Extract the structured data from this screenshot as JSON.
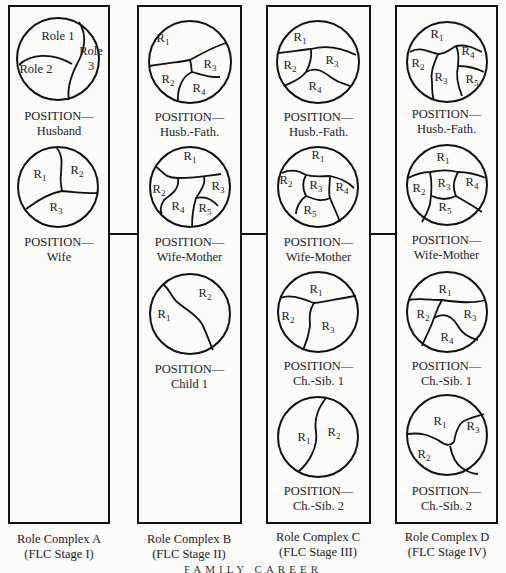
{
  "figure": {
    "footer_title": "FAMILY CAREER",
    "colors": {
      "stroke": "#111111",
      "background": "#fbfbf9",
      "text": "#222222"
    },
    "complexes": [
      {
        "id": "A",
        "caption_line1": "Role Complex A",
        "caption_line2": "(FLC Stage I)",
        "positions": [
          {
            "label_line1": "POSITION—",
            "label_line2": "Husband",
            "roles": [
              "Role 1",
              "Role 2",
              "Role 3"
            ]
          },
          {
            "label_line1": "POSITION—",
            "label_line2": "Wife",
            "roles": [
              "R1",
              "R2",
              "R3"
            ]
          }
        ]
      },
      {
        "id": "B",
        "caption_line1": "Role Complex B",
        "caption_line2": "(FLC Stage II)",
        "positions": [
          {
            "label_line1": "POSITION—",
            "label_line2": "Husb.-Fath.",
            "roles": [
              "R1",
              "R2",
              "R3",
              "R4"
            ]
          },
          {
            "label_line1": "POSITION—",
            "label_line2": "Wife-Mother",
            "roles": [
              "R1",
              "R2",
              "R3",
              "R4",
              "R5"
            ]
          },
          {
            "label_line1": "POSITION—",
            "label_line2": "Child 1",
            "roles": [
              "R1",
              "R2"
            ]
          }
        ]
      },
      {
        "id": "C",
        "caption_line1": "Role Complex C",
        "caption_line2": "(FLC Stage III)",
        "positions": [
          {
            "label_line1": "POSITION—",
            "label_line2": "Husb.-Fath.",
            "roles": [
              "R1",
              "R2",
              "R3",
              "R4"
            ]
          },
          {
            "label_line1": "POSITION—",
            "label_line2": "Wife-Mother",
            "roles": [
              "R1",
              "R2",
              "R3",
              "R4",
              "R5"
            ]
          },
          {
            "label_line1": "POSITION—",
            "label_line2": "Ch.-Sib. 1",
            "roles": [
              "R1",
              "R2",
              "R3"
            ]
          },
          {
            "label_line1": "POSITION—",
            "label_line2": "Ch.-Sib. 2",
            "roles": [
              "R1",
              "R2"
            ]
          }
        ]
      },
      {
        "id": "D",
        "caption_line1": "Role Complex D",
        "caption_line2": "(FLC Stage IV)",
        "positions": [
          {
            "label_line1": "POSITION—",
            "label_line2": "Husb.-Fath.",
            "roles": [
              "R1",
              "R2",
              "R3",
              "R4",
              "R5"
            ]
          },
          {
            "label_line1": "POSITION—",
            "label_line2": "Wife-Mother",
            "roles": [
              "R1",
              "R2",
              "R3",
              "R4",
              "R5"
            ]
          },
          {
            "label_line1": "POSITION—",
            "label_line2": "Ch.-Sib. 1",
            "roles": [
              "R1",
              "R2",
              "R3",
              "R4"
            ]
          },
          {
            "label_line1": "POSITION—",
            "label_line2": "Ch.-Sib. 2",
            "roles": [
              "R1",
              "R2",
              "R3"
            ]
          }
        ]
      }
    ]
  }
}
